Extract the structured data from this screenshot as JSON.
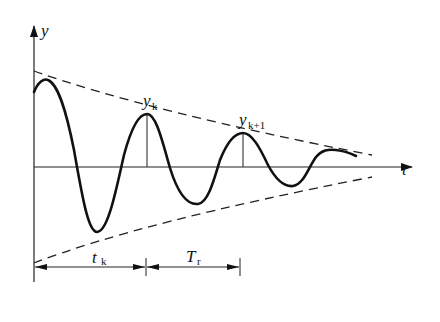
{
  "diagram": {
    "axes": {
      "y_label": "y",
      "x_label": "t"
    },
    "annotations": {
      "peak_k": {
        "base": "y",
        "sub": "k"
      },
      "peak_k1": {
        "base": "y",
        "sub": "k+1"
      },
      "time_to_peak": {
        "base": "t",
        "sub": "k"
      },
      "period": {
        "base": "T",
        "sub": "r"
      }
    },
    "colors": {
      "line": "#111111",
      "background": "#ffffff"
    },
    "curves": [
      {
        "name": "response",
        "style": "solid"
      },
      {
        "name": "upper-envelope",
        "style": "dashed"
      },
      {
        "name": "lower-envelope",
        "style": "dashed"
      }
    ]
  }
}
